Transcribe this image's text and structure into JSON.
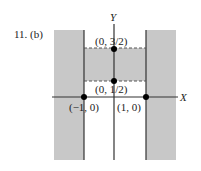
{
  "problem_label": "11. (b)",
  "axes": {
    "x_label": "X",
    "y_label": "Y"
  },
  "points": [
    {
      "id": "p-top",
      "label": "(0, 3/2)"
    },
    {
      "id": "p-mid",
      "label": "(0, 1/2)"
    },
    {
      "id": "p-left",
      "label": "(−1, 0)"
    },
    {
      "id": "p-right",
      "label": "(1, 0)"
    }
  ],
  "colors": {
    "shade": "#c8c8c8",
    "line": "#333333",
    "point": "#000000"
  }
}
